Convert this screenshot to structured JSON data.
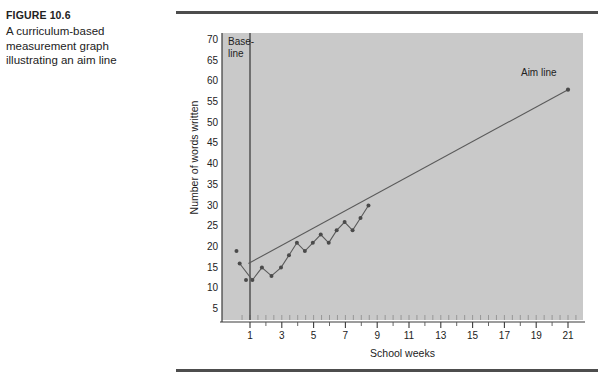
{
  "figure": {
    "number": "FIGURE 10.6",
    "caption": "A curriculum-based\nmeasurement graph\nillustrating an aim line"
  },
  "chart_data": {
    "type": "line",
    "title": "",
    "xlabel": "School weeks",
    "ylabel": "Number of words written",
    "xlim": [
      0,
      22
    ],
    "ylim": [
      0,
      72
    ],
    "y_ticks": [
      5,
      10,
      15,
      20,
      25,
      30,
      35,
      40,
      45,
      50,
      55,
      60,
      65,
      70
    ],
    "x_ticks": [
      1,
      3,
      5,
      7,
      9,
      11,
      13,
      15,
      17,
      19,
      21
    ],
    "x_minor_ticks": [
      2,
      4,
      6,
      8,
      10,
      12,
      14,
      16,
      18,
      20
    ],
    "grid": false,
    "legend": "none",
    "plot_bgcolor": "#c9c9c9",
    "marker_color": "#4a4a4a",
    "line_color": "#5a5a5a",
    "annotations": [
      {
        "name": "baseline-label",
        "text": "Base-\nline",
        "x": 1.0,
        "y": 70
      },
      {
        "name": "aim-line-label",
        "text": "Aim line",
        "x": 19.3,
        "y": 62
      }
    ],
    "baseline_divider": {
      "x": 1.0,
      "label": "Baseline phase divider"
    },
    "series": [
      {
        "name": "Baseline probes",
        "type": "scatter",
        "points": [
          {
            "x": 0.15,
            "y": 19
          },
          {
            "x": 0.75,
            "y": 12
          }
        ]
      },
      {
        "name": "Words written per week",
        "type": "line",
        "points": [
          {
            "x": 0.35,
            "y": 16
          },
          {
            "x": 1.15,
            "y": 12
          },
          {
            "x": 1.75,
            "y": 15
          },
          {
            "x": 2.35,
            "y": 13
          },
          {
            "x": 2.95,
            "y": 15
          },
          {
            "x": 3.45,
            "y": 18
          },
          {
            "x": 3.95,
            "y": 21
          },
          {
            "x": 4.45,
            "y": 19
          },
          {
            "x": 4.95,
            "y": 21
          },
          {
            "x": 5.45,
            "y": 23
          },
          {
            "x": 5.95,
            "y": 21
          },
          {
            "x": 6.45,
            "y": 24
          },
          {
            "x": 6.95,
            "y": 26
          },
          {
            "x": 7.45,
            "y": 24
          },
          {
            "x": 7.95,
            "y": 27
          },
          {
            "x": 8.45,
            "y": 30
          }
        ]
      },
      {
        "name": "Aim line",
        "type": "line",
        "points": [
          {
            "x": 0.9,
            "y": 16
          },
          {
            "x": 21.0,
            "y": 58
          }
        ],
        "endpoint_marker": {
          "x": 21.0,
          "y": 58
        }
      }
    ]
  }
}
